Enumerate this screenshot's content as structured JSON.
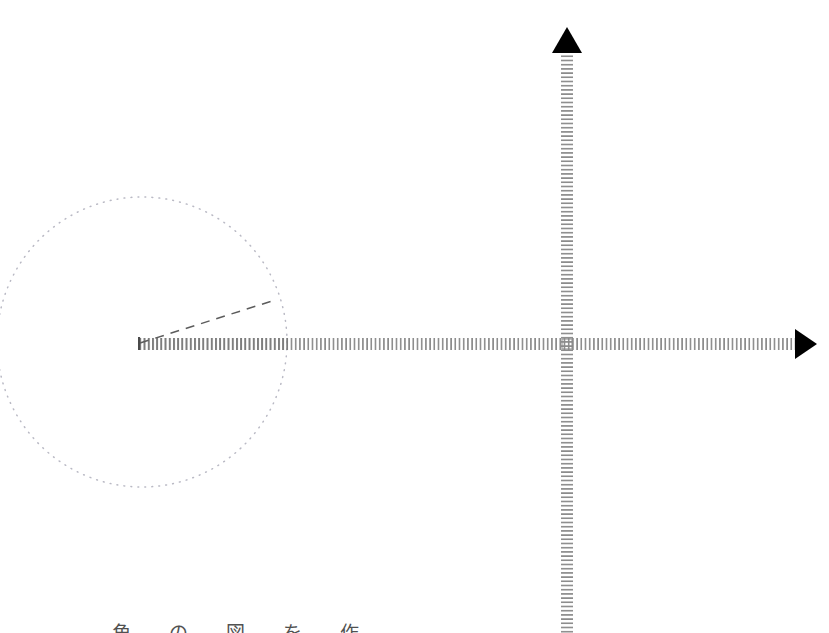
{
  "figure": {
    "background_color": "#ffffff",
    "width": 829,
    "height": 633,
    "caption_clipped": "角 の 図 を 作",
    "colors": {
      "axis_tick": "#8a8a8a",
      "arrowhead": "#000000",
      "circle_stroke": "#b9b9c4",
      "ray_dash": "#5c5c5c",
      "initial_side_hatch": "#7d7d7d"
    },
    "elements": {
      "circle": {
        "name": "unit-circle",
        "center_x": 142,
        "center_y": 342,
        "radius": 145,
        "stroke_style": "dotted",
        "stroke_width": 1.4
      },
      "x_axis": {
        "name": "x-axis",
        "y": 344,
        "x_start": 138,
        "x_end": 795,
        "arrow_tip_x": 817,
        "style": "hatched-ticks",
        "tick_spacing": 4.2,
        "tick_height": 11
      },
      "y_axis": {
        "name": "y-axis",
        "x": 567,
        "y_start": 52,
        "y_end": 633,
        "arrow_tip_y": 27,
        "style": "hatched-ticks",
        "tick_spacing": 4.2,
        "tick_width": 11
      },
      "vertex": {
        "name": "angle-vertex",
        "x": 139,
        "y": 343
      },
      "terminal_ray": {
        "name": "terminal-side-ray",
        "x1": 140,
        "y1": 343,
        "x2": 272,
        "y2": 301,
        "angle_degrees": 17.6,
        "stroke_style": "dashed",
        "dash_pattern": "9 7",
        "stroke_width": 1.5
      },
      "origin_marker": {
        "name": "origin-crosshair",
        "x": 567,
        "y": 344
      }
    }
  }
}
